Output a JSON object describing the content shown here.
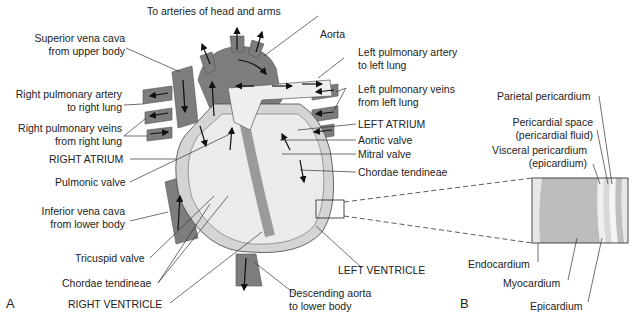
{
  "figure": {
    "panel_a_letter": "A",
    "panel_b_letter": "B"
  },
  "labels_a": {
    "arteries_head_arms": "To arteries of head and arms",
    "aorta": "Aorta",
    "svc_line1": "Superior vena cava",
    "svc_line2": "from upper body",
    "rpa_line1": "Right pulmonary artery",
    "rpa_line2": "to right lung",
    "rpv_line1": "Right pulmonary veins",
    "rpv_line2": "from right lung",
    "right_atrium": "RIGHT ATRIUM",
    "pulmonic_valve": "Pulmonic valve",
    "ivc_line1": "Inferior vena cava",
    "ivc_line2": "from lower body",
    "tricuspid_valve": "Tricuspid valve",
    "chordae_left": "Chordae tendineae",
    "right_ventricle": "RIGHT VENTRICLE",
    "lpa_line1": "Left pulmonary artery",
    "lpa_line2": "to left lung",
    "lpv_line1": "Left pulmonary veins",
    "lpv_line2": "from left lung",
    "left_atrium": "LEFT ATRIUM",
    "aortic_valve": "Aortic valve",
    "mitral_valve": "Mitral valve",
    "chordae_right": "Chordae tendineae",
    "left_ventricle": "LEFT VENTRICLE",
    "desc_aorta_line1": "Descending aorta",
    "desc_aorta_line2": "to lower body"
  },
  "labels_b": {
    "parietal": "Parietal pericardium",
    "space_line1": "Pericardial space",
    "space_line2": "(pericardial fluid)",
    "visceral_line1": "Visceral pericardium",
    "visceral_line2": "(epicardium)",
    "endocardium": "Endocardium",
    "myocardium": "Myocardium",
    "epicardium": "Epicardium"
  },
  "colors": {
    "vessel_dark": "#7d7d7d",
    "chamber_light": "#ececec",
    "wall_mid": "#c8c8c8",
    "myocardium": "#bdbdbd",
    "line": "#2a2a2a"
  }
}
